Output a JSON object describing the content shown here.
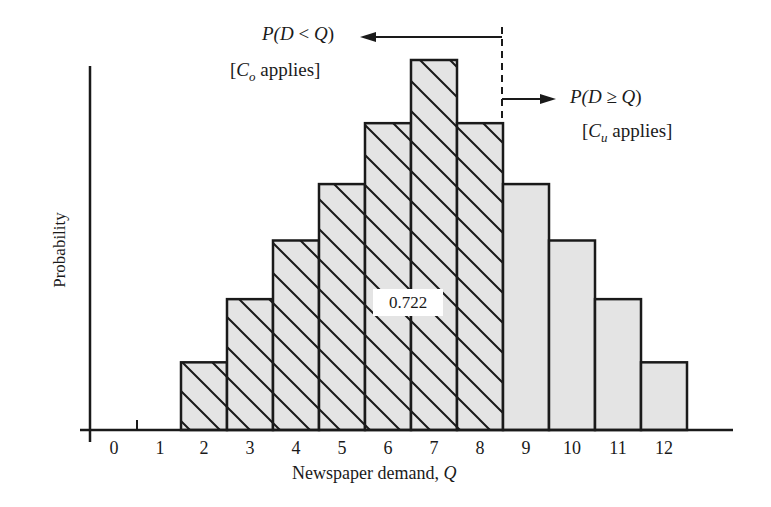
{
  "chart_data": {
    "type": "bar",
    "title": "",
    "xlabel": "Newspaper demand, Q",
    "xlabel_text": "Newspaper demand, ",
    "xlabel_var": "Q",
    "ylabel": "Probability",
    "categories": [
      "0",
      "1",
      "2",
      "3",
      "4",
      "5",
      "6",
      "7",
      "8",
      "9",
      "10",
      "11",
      "12"
    ],
    "values": [
      0,
      0,
      0.03,
      0.058,
      0.084,
      0.109,
      0.136,
      0.164,
      0.136,
      0.109,
      0.084,
      0.058,
      0.03
    ],
    "hatched_categories": [
      "2",
      "3",
      "4",
      "5",
      "6",
      "7",
      "8"
    ],
    "grid": false,
    "legend": null,
    "annotations": [
      {
        "text": "P(D < Q)",
        "position": "top-left of dashed line",
        "arrow": "left"
      },
      {
        "text": "[Co applies]",
        "position": "below P(D < Q)"
      },
      {
        "text": "P(D ≥ Q)",
        "position": "right of dashed line",
        "arrow": "right"
      },
      {
        "text": "[Cu applies]",
        "position": "below P(D ≥ Q)"
      },
      {
        "text": "0.722",
        "position": "inside hatched region",
        "meaning": "cumulative probability of hatched bars"
      }
    ],
    "split_at": 8.5
  },
  "labels": {
    "left_annotation": {
      "p": "P(",
      "d": "D",
      "op": " < ",
      "q": "Q",
      "close": ")"
    },
    "left_cost": {
      "open": "[",
      "c": "C",
      "sub": "o",
      "rest": " applies]"
    },
    "right_annotation": {
      "p": "P(",
      "d": "D",
      "op": " ≥ ",
      "q": "Q",
      "close": ")"
    },
    "right_cost": {
      "open": "[",
      "c": "C",
      "sub": "u",
      "rest": " applies]"
    },
    "cumulative_value": "0.722"
  },
  "colors": {
    "bar_fill": "#e4e4e4",
    "stroke": "#1a1a1a",
    "background": "#ffffff"
  }
}
